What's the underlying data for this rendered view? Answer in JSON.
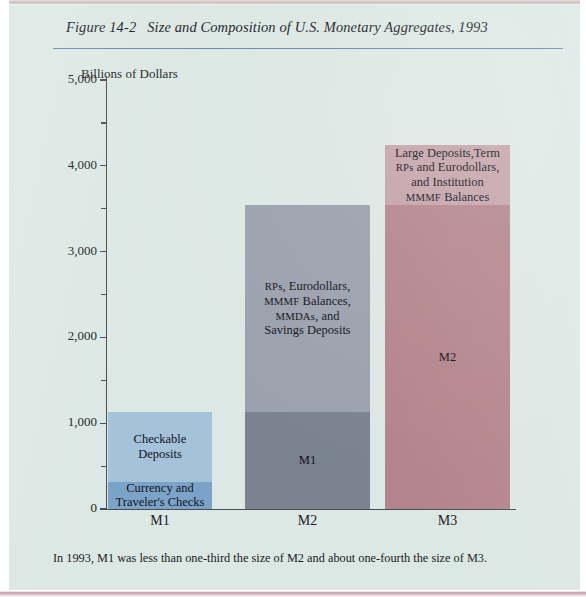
{
  "figure": {
    "number": "Figure 14-2",
    "title": "Size and Composition of U.S. Monetary Aggregates, 1993",
    "caption": "In 1993, M1 was less than one-third the size of M2 and about one-fourth the size of M3.",
    "background_color": "#dce8e4",
    "rule_color": "#6c86b0"
  },
  "chart_data": {
    "type": "bar",
    "stacked": true,
    "title": "Size and Composition of U.S. Monetary Aggregates, 1993",
    "xlabel": "",
    "ylabel": "Billions of Dollars",
    "ylim": [
      0,
      5000
    ],
    "ytick_labels": [
      "0",
      "1,000",
      "2,000",
      "3,000",
      "4,000",
      "5,000"
    ],
    "ytick_values": [
      0,
      1000,
      2000,
      3000,
      4000,
      5000
    ],
    "minor_tick_values": [
      500,
      1500,
      2500,
      3500,
      4500
    ],
    "grid": false,
    "legend": "none",
    "categories": [
      "M1",
      "M2",
      "M3"
    ],
    "totals": [
      1125,
      3545,
      4240
    ],
    "bars": [
      {
        "category": "M1",
        "total": 1125,
        "segments": [
          {
            "label": "Currency and\nTraveler's Checks",
            "label_line1": "Currency and",
            "label_line2": "Traveler's Checks",
            "value": 320,
            "from": 0,
            "to": 320,
            "color": "#7ba3c8"
          },
          {
            "label": "Checkable Deposits",
            "label_line1": "Checkable Deposits",
            "value": 805,
            "from": 320,
            "to": 1125,
            "color": "#a4c2da"
          }
        ]
      },
      {
        "category": "M2",
        "total": 3545,
        "segments": [
          {
            "label": "M1",
            "label_line1": "M1",
            "value": 1125,
            "from": 0,
            "to": 1125,
            "color": "#7b8290"
          },
          {
            "label": "RPs, Eurodollars, MMMF Balances, MMDAs, and Savings Deposits",
            "label_line1": "RPs, Eurodollars,",
            "label_line2": "MMMF Balances,",
            "label_line3": "MMDAs, and",
            "label_line4": "Savings Deposits",
            "value": 2420,
            "from": 1125,
            "to": 3545,
            "color": "#9ba2ad"
          }
        ]
      },
      {
        "category": "M3",
        "total": 4240,
        "segments": [
          {
            "label": "M2",
            "label_line1": "M2",
            "value": 3545,
            "from": 0,
            "to": 3545,
            "color": "#b4848c"
          },
          {
            "label": "Large Deposits, Term RPs and Eurodollars, and Institution MMMF Balances",
            "label_line1": "Large Deposits,Term",
            "label_line2": "RPs and Eurodollars,",
            "label_line3": "and Institution",
            "label_line4": "MMMF Balances",
            "value": 695,
            "from": 3545,
            "to": 4240,
            "color": "#c4a3a9"
          }
        ]
      }
    ]
  }
}
